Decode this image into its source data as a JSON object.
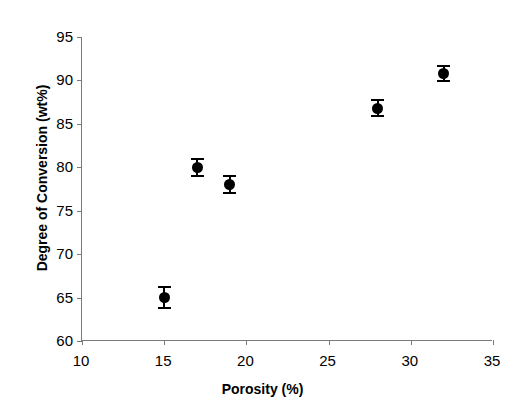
{
  "chart_data": {
    "type": "scatter",
    "title": "",
    "xlabel": "Porosity (%)",
    "ylabel": "Degree of Conversion (wt%)",
    "xlim": [
      10,
      35
    ],
    "ylim": [
      60,
      95
    ],
    "xticks": [
      10,
      15,
      20,
      25,
      30,
      35
    ],
    "yticks": [
      60,
      65,
      70,
      75,
      80,
      85,
      90,
      95
    ],
    "xtick_labels": [
      "10",
      "15",
      "20",
      "25",
      "30",
      "35"
    ],
    "ytick_labels": [
      "60",
      "65",
      "70",
      "75",
      "80",
      "85",
      "90",
      "95"
    ],
    "grid": false,
    "legend": false,
    "marker_color": "#000000",
    "axis_color": "#7a7a7a",
    "error_bars": true,
    "x": [
      15,
      17,
      19,
      28,
      32
    ],
    "y": [
      65.0,
      80.0,
      78.0,
      86.8,
      90.8
    ],
    "yerr": [
      1.2,
      1.0,
      1.0,
      0.9,
      0.9
    ],
    "points": [
      {
        "x": 15,
        "y": 65.0,
        "yerr": 1.2
      },
      {
        "x": 17,
        "y": 80.0,
        "yerr": 1.0
      },
      {
        "x": 19,
        "y": 78.0,
        "yerr": 1.0
      },
      {
        "x": 28,
        "y": 86.8,
        "yerr": 0.9
      },
      {
        "x": 32,
        "y": 90.8,
        "yerr": 0.9
      }
    ]
  }
}
